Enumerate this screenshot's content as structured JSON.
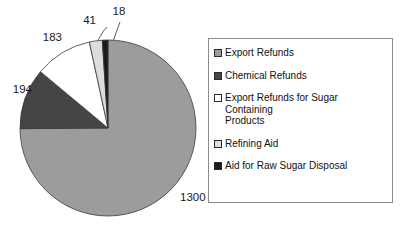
{
  "chart_data": {
    "type": "pie",
    "title": "",
    "xlabel": "",
    "ylabel": "",
    "total": 1736,
    "categories": [
      "Export Refunds",
      "Chemical Refunds",
      "Export Refunds for Sugar Containing Products",
      "Refining Aid",
      "Aid for Raw Sugar Disposal"
    ],
    "values": [
      1300,
      194,
      183,
      41,
      18
    ],
    "data_labels": [
      "1300",
      "194",
      "183",
      "41",
      "18"
    ],
    "colors": [
      "#9c9c9c",
      "#454545",
      "#ffffff",
      "#dcdcdc",
      "#1a1a1a"
    ],
    "legend_position": "right",
    "grid": false,
    "slices": [
      {
        "label": "Export Refunds",
        "value": 1300,
        "data_label": "1300",
        "color": "#9c9c9c"
      },
      {
        "label": "Chemical Refunds",
        "value": 194,
        "data_label": "194",
        "color": "#454545"
      },
      {
        "label": "Export Refunds for Sugar Containing Products",
        "value": 183,
        "data_label": "183",
        "color": "#ffffff"
      },
      {
        "label": "Refining Aid",
        "value": 41,
        "data_label": "41",
        "color": "#dcdcdc"
      },
      {
        "label": "Aid for Raw Sugar Disposal",
        "value": 18,
        "data_label": "18",
        "color": "#1a1a1a"
      }
    ]
  },
  "legend": {
    "items": [
      {
        "label": "Export Refunds",
        "color": "#9c9c9c"
      },
      {
        "label": "Chemical Refunds",
        "color": "#454545"
      },
      {
        "label": "Export Refunds for Sugar Containing\n Products",
        "color": "#ffffff"
      },
      {
        "label": "Refining Aid",
        "color": "#dcdcdc"
      },
      {
        "label": "Aid for Raw Sugar Disposal",
        "color": "#1a1a1a"
      }
    ]
  }
}
